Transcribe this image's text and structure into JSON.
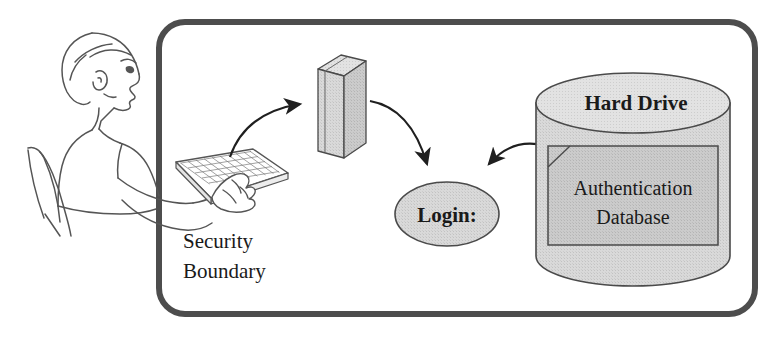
{
  "diagram": {
    "background_color": "#ffffff",
    "stroke_color": "#3a3a3a",
    "fill_gray": "#d4d4d4",
    "fill_gray_light": "#dcdcdc",
    "boundary": {
      "label_line1": "Security",
      "label_line2": "Boundary",
      "border_color": "#4a4a4a"
    },
    "nodes": {
      "person": {
        "name": "seated-user",
        "label": ""
      },
      "keyboard": {
        "name": "keyboard",
        "label": ""
      },
      "tower": {
        "name": "computer-tower",
        "label": ""
      },
      "login": {
        "name": "login-prompt",
        "label": "Login:"
      },
      "hard_drive": {
        "name": "hard-drive",
        "label": "Hard Drive"
      },
      "auth_db": {
        "name": "authentication-database",
        "label_line1": "Authentication",
        "label_line2": "Database"
      }
    },
    "arrows": [
      {
        "name": "arrow-keyboard-to-tower",
        "from": "keyboard",
        "to": "tower"
      },
      {
        "name": "arrow-tower-to-login",
        "from": "tower",
        "to": "login"
      },
      {
        "name": "arrow-database-to-login",
        "from": "authentication-database",
        "to": "login"
      }
    ]
  }
}
